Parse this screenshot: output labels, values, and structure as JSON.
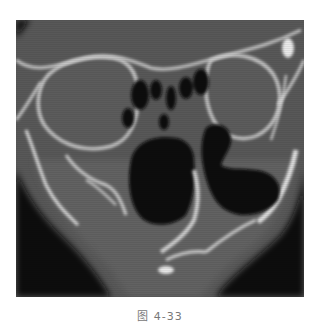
{
  "figure": {
    "type": "CT scan, coronal view of paranasal sinuses",
    "colors": {
      "soft_tissue": "#5a5a5a",
      "bone": "#d8d8d8",
      "air": "#0a0a0a",
      "background": "#ffffff"
    }
  },
  "caption": {
    "text": "图 4-33"
  }
}
